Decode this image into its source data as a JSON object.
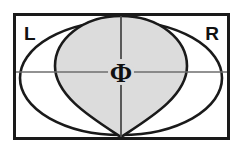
{
  "figure": {
    "background_color": "#ffffff",
    "frame": {
      "stroke_color": "#1a1a1a",
      "fill_color": "#ffffff",
      "x": 13,
      "y": 13,
      "width": 217,
      "height": 127,
      "stroke_width": 3
    },
    "labels": {
      "left": "L",
      "right": "R",
      "center_symbol": "Φ"
    },
    "shapes": {
      "outer_ellipse": {
        "name": "outer-ellipse",
        "fill_color": "#ffffff",
        "stroke_color": "#1a1a1a",
        "center_x": 121,
        "center_y": 78,
        "radius_x": 101,
        "radius_y": 57
      },
      "cardioid": {
        "name": "cardioid-region",
        "fill_color": "#dcdcdc",
        "stroke_color": "#1a1a1a",
        "cusp_x": 121,
        "cusp_y": 137,
        "top_y": 16,
        "half_width": 66
      },
      "crosshair": {
        "name": "crosshair",
        "stroke_color": "#6e6e6e",
        "horizontal_y": 72,
        "vertical_x": 121
      }
    },
    "colors": {
      "ink": "#1a1a1a",
      "shaded_region": "#dcdcdc",
      "crosshair": "#6e6e6e",
      "paper": "#ffffff"
    }
  }
}
